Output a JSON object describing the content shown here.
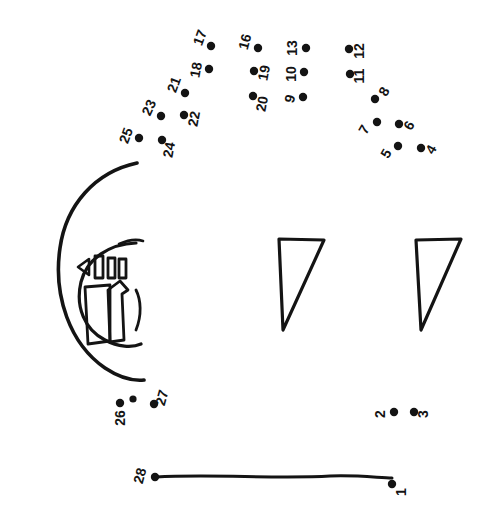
{
  "document": {
    "title": "Connect the Dots Drawing",
    "kind": "connect-the-dots-puzzle",
    "canvas": {
      "width": 489,
      "height": 527
    },
    "background_color": "#ffffff",
    "ink_color": "#141414"
  },
  "dots": [
    {
      "number": "1",
      "cx": 392,
      "cy": 484,
      "label_x": 402,
      "label_y": 492,
      "label_rotation": -90
    },
    {
      "number": "2",
      "cx": 394,
      "cy": 412,
      "label_x": 381,
      "label_y": 414,
      "label_rotation": -90
    },
    {
      "number": "3",
      "cx": 414,
      "cy": 412,
      "label_x": 424,
      "label_y": 414,
      "label_rotation": -90
    },
    {
      "number": "4",
      "cx": 421,
      "cy": 148,
      "label_x": 432,
      "label_y": 150,
      "label_rotation": -60
    },
    {
      "number": "5",
      "cx": 398,
      "cy": 146,
      "label_x": 387,
      "label_y": 154,
      "label_rotation": -60
    },
    {
      "number": "6",
      "cx": 399,
      "cy": 124,
      "label_x": 410,
      "label_y": 126,
      "label_rotation": -60
    },
    {
      "number": "7",
      "cx": 377,
      "cy": 122,
      "label_x": 365,
      "label_y": 130,
      "label_rotation": -60
    },
    {
      "number": "8",
      "cx": 375,
      "cy": 99,
      "label_x": 385,
      "label_y": 92,
      "label_rotation": -60
    },
    {
      "number": "9",
      "cx": 303,
      "cy": 97,
      "label_x": 291,
      "label_y": 99,
      "label_rotation": -75
    },
    {
      "number": "10",
      "cx": 304,
      "cy": 72,
      "label_x": 292,
      "label_y": 74,
      "label_rotation": -90
    },
    {
      "number": "11",
      "cx": 350,
      "cy": 74,
      "label_x": 360,
      "label_y": 76,
      "label_rotation": -90
    },
    {
      "number": "12",
      "cx": 349,
      "cy": 49,
      "label_x": 360,
      "label_y": 51,
      "label_rotation": -90
    },
    {
      "number": "13",
      "cx": 306,
      "cy": 48,
      "label_x": 293,
      "label_y": 48,
      "label_rotation": -90
    },
    {
      "number": "16",
      "cx": 258,
      "cy": 48,
      "label_x": 246,
      "label_y": 42,
      "label_rotation": -75
    },
    {
      "number": "17",
      "cx": 211,
      "cy": 46,
      "label_x": 201,
      "label_y": 38,
      "label_rotation": -70
    },
    {
      "number": "18",
      "cx": 209,
      "cy": 69,
      "label_x": 197,
      "label_y": 70,
      "label_rotation": -80
    },
    {
      "number": "19",
      "cx": 254,
      "cy": 71,
      "label_x": 265,
      "label_y": 73,
      "label_rotation": -80
    },
    {
      "number": "20",
      "cx": 253,
      "cy": 96,
      "label_x": 263,
      "label_y": 104,
      "label_rotation": -80
    },
    {
      "number": "21",
      "cx": 185,
      "cy": 93,
      "label_x": 175,
      "label_y": 85,
      "label_rotation": -70
    },
    {
      "number": "22",
      "cx": 184,
      "cy": 115,
      "label_x": 195,
      "label_y": 119,
      "label_rotation": -80
    },
    {
      "number": "23",
      "cx": 161,
      "cy": 116,
      "label_x": 150,
      "label_y": 108,
      "label_rotation": -65
    },
    {
      "number": "24",
      "cx": 162,
      "cy": 140,
      "label_x": 170,
      "label_y": 150,
      "label_rotation": -80
    },
    {
      "number": "25",
      "cx": 139,
      "cy": 138,
      "label_x": 127,
      "label_y": 136,
      "label_rotation": -70
    },
    {
      "number": "26",
      "cx": 120,
      "cy": 403,
      "label_x": 121,
      "label_y": 418,
      "label_rotation": -90
    },
    {
      "number": "27",
      "cx": 154,
      "cy": 404,
      "label_x": 163,
      "label_y": 398,
      "label_rotation": -75
    },
    {
      "number": "28",
      "cx": 155,
      "cy": 477,
      "label_x": 141,
      "label_y": 476,
      "label_rotation": -75
    }
  ],
  "extra_dots": [
    {
      "cx": 133,
      "cy": 399
    }
  ],
  "strokes": {
    "outer_arc": {
      "name": "large-left-arc",
      "path": "M 137 163 C 95 172 66 205 60 248 C 53 296 70 344 105 368 C 120 378 134 381 144 380"
    },
    "inner_arc": {
      "name": "inner-head-arc",
      "path": "M 136 243 C 110 244 87 258 81 282 C 75 307 85 330 105 340 C 118 347 132 348 141 344"
    },
    "inner_arc_tail": {
      "name": "inner-head-arc-top-tail",
      "path": "M 119 244 C 128 240 137 239 143 241"
    },
    "inner_arc_right": {
      "name": "inner-head-arc-right",
      "path": "M 136 290 C 141 300 142 315 136 330"
    },
    "triangle_small_left": {
      "name": "eye-triangle-left",
      "path": "M 89 259 L 89 275 L 78 267 Z"
    },
    "bars": [
      {
        "name": "tooth-bar-1",
        "x": 95,
        "y": 256,
        "w": 8,
        "h": 22
      },
      {
        "name": "tooth-bar-2",
        "x": 108,
        "y": 258,
        "w": 7,
        "h": 20
      },
      {
        "name": "tooth-bar-3",
        "x": 119,
        "y": 259,
        "w": 7,
        "h": 19
      }
    ],
    "body_quad": {
      "name": "body-quad",
      "path": "M 85 287 L 110 285 L 110 341 L 88 344 Z"
    },
    "snout_shape": {
      "name": "snout-shape",
      "path": "M 108 290 L 120 281 L 128 290 L 122 294 L 124 340 L 110 342 Z"
    },
    "triangle_mid": {
      "name": "leg-triangle-middle",
      "path": "M 279 239 L 324 240 L 283 330 Z"
    },
    "triangle_right": {
      "name": "leg-triangle-right",
      "path": "M 416 240 L 461 239 L 421 330 Z"
    },
    "baseline": {
      "name": "ground-baseline",
      "path": "M 156 477 C 210 474 280 479 330 476 C 360 475 380 478 392 478"
    }
  }
}
